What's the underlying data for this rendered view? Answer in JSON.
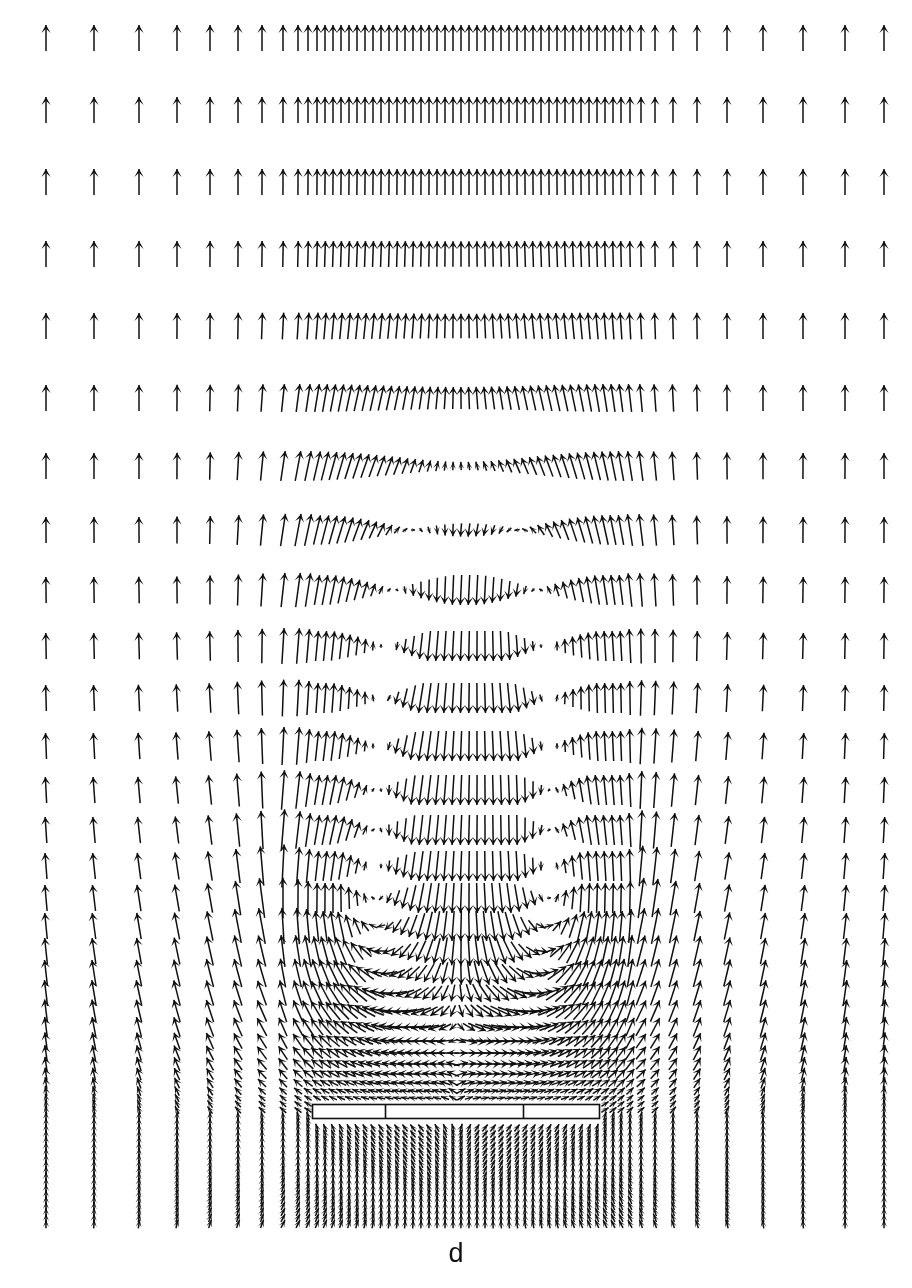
{
  "figure": {
    "kind": "velocity-vector-field",
    "panel_label": "d",
    "panel_label_y": 1238,
    "width": 912,
    "height": 1288,
    "background_color": "#ffffff",
    "ink_color": "#101010"
  },
  "arrow_style": {
    "shaft_width": 1.5,
    "head_half_width": 4.6,
    "head_length": 5.2,
    "head_sweep": 0.55,
    "min_length": 3.0,
    "max_length": 62.0,
    "color": "#101010"
  },
  "obstacle": {
    "name": "plate",
    "x0": 312,
    "x1": 600,
    "y0": 1104,
    "y1": 1119,
    "stroke": "#101010",
    "stroke_width": 1.6,
    "fill": "#ffffff",
    "dividers": [
      385,
      523
    ]
  },
  "grid": {
    "note": "Non-uniform stretched grid: columns cluster toward the centre, rows cluster toward the bottom.",
    "x_columns": [
      46,
      94,
      139,
      177,
      210,
      238,
      262,
      283,
      298,
      308,
      317,
      325,
      333,
      341,
      349,
      357,
      365,
      373,
      381,
      389,
      397,
      405,
      413,
      421,
      429,
      437,
      445,
      453,
      461,
      469,
      477,
      485,
      493,
      501,
      509,
      517,
      525,
      533,
      541,
      549,
      557,
      565,
      573,
      581,
      589,
      597,
      605,
      613,
      621,
      630,
      641,
      655,
      673,
      697,
      727,
      763,
      803,
      845,
      884
    ],
    "y_rows": [
      38,
      110,
      182,
      254,
      326,
      398,
      466,
      530,
      590,
      646,
      698,
      746,
      790,
      830,
      866,
      898,
      926,
      951,
      973,
      993,
      1011,
      1027,
      1041,
      1053,
      1064,
      1074,
      1083,
      1091,
      1098,
      1104,
      1110,
      1116,
      1122,
      1128,
      1134,
      1140,
      1146,
      1152,
      1158,
      1164,
      1170,
      1176,
      1182,
      1188,
      1194,
      1200,
      1206,
      1212,
      1218,
      1224
    ]
  },
  "flow_model": {
    "inlet_speed": 1.0,
    "far_field_direction_deg": 90,
    "plate_center_x": 456,
    "plate_half_width": 144,
    "plate_y": 1110,
    "vortices": [
      {
        "name": "left-recirculation-vortex",
        "cx": 352,
        "cy": 930,
        "rx": 72,
        "ry": 150,
        "circulation": 1.0,
        "sense": "counter-clockwise"
      },
      {
        "name": "right-recirculation-vortex",
        "cx": 560,
        "cy": 930,
        "rx": 72,
        "ry": 150,
        "circulation": -1.0,
        "sense": "clockwise"
      },
      {
        "name": "upper-left-shear-vortex",
        "cx": 372,
        "cy": 660,
        "rx": 96,
        "ry": 190,
        "circulation": 0.55,
        "sense": "counter-clockwise"
      },
      {
        "name": "upper-right-shear-vortex",
        "cx": 546,
        "cy": 660,
        "rx": 96,
        "ry": 190,
        "circulation": -0.55,
        "sense": "clockwise"
      }
    ],
    "wake_jet": {
      "name": "central-downwash",
      "cx": 470,
      "top_y": 430,
      "bottom_y": 1090,
      "half_width": 105,
      "strength": 0.95
    },
    "source_below_plate": {
      "name": "plate-underside-upwash",
      "cx": 456,
      "cy": 1175,
      "strength": 0.85
    }
  }
}
